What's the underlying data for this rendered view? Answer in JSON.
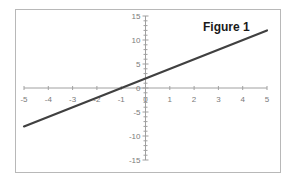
{
  "chart_data": {
    "type": "line",
    "title": "Figure 1",
    "xlabel": "",
    "ylabel": "",
    "xlim": [
      -5,
      5
    ],
    "ylim": [
      -15,
      15
    ],
    "x_ticks": [
      -5,
      -4,
      -3,
      -2,
      -1,
      0,
      1,
      2,
      3,
      4,
      5
    ],
    "y_ticks": [
      -15,
      -10,
      -5,
      0,
      5,
      10,
      15
    ],
    "grid": false,
    "legend": null,
    "series": [
      {
        "name": "y = 2x + 2",
        "x": [
          -5,
          5
        ],
        "y": [
          -8,
          12
        ],
        "color": "#404040"
      }
    ]
  },
  "labels": {
    "title": "Figure 1",
    "x_ticks": [
      "-5",
      "-4",
      "-3",
      "-2",
      "-1",
      "0",
      "1",
      "2",
      "3",
      "4",
      "5"
    ],
    "y_ticks": [
      "15",
      "10",
      "5",
      "0",
      "-5",
      "-10",
      "-15"
    ]
  },
  "colors": {
    "axis": "#a0a0a0",
    "line": "#404040",
    "frame": "#b8b8b8"
  }
}
